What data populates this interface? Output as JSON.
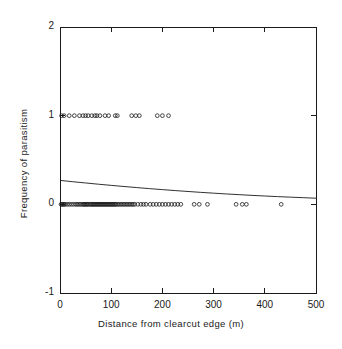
{
  "figure": {
    "background": "#ffffff",
    "ink_color": "#1a1a1a",
    "frame": {
      "left": 60,
      "right": 316,
      "top": 27,
      "bottom": 293
    }
  },
  "chart_data": {
    "type": "scatter",
    "title": "",
    "xlabel": "Distance from clearcut edge (m)",
    "ylabel": "Frequency of parasitism",
    "xlim": [
      0,
      500
    ],
    "ylim": [
      -1,
      2
    ],
    "xticks": [
      0,
      100,
      200,
      300,
      400,
      500
    ],
    "xtick_labels": [
      "0",
      "100",
      "200",
      "300",
      "400",
      "500"
    ],
    "yticks": [
      -1,
      0,
      1,
      2
    ],
    "ytick_labels": [
      "-1",
      "0",
      "1",
      "2"
    ],
    "grid": false,
    "legend": null,
    "marker": {
      "shape": "open-circle",
      "size": 3.0,
      "edge_color": "#1a1a1a",
      "fill": "none"
    },
    "series": [
      {
        "name": "Parasitized (y = 1)",
        "y_value": 1,
        "x": [
          3,
          8,
          18,
          28,
          38,
          45,
          50,
          55,
          62,
          68,
          72,
          78,
          88,
          95,
          108,
          112,
          140,
          148,
          155,
          190,
          200,
          212
        ]
      },
      {
        "name": "Not parasitized (y = 0)",
        "y_value": 0,
        "x": [
          2,
          4,
          6,
          8,
          10,
          14,
          18,
          22,
          26,
          30,
          33,
          36,
          39,
          42,
          45,
          47,
          49,
          51,
          53,
          55,
          58,
          60,
          62,
          64,
          66,
          68,
          70,
          72,
          74,
          76,
          78,
          80,
          82,
          84,
          86,
          88,
          90,
          92,
          94,
          96,
          98,
          100,
          102,
          104,
          106,
          108,
          110,
          113,
          116,
          119,
          122,
          125,
          128,
          131,
          134,
          137,
          140,
          143,
          146,
          152,
          158,
          163,
          168,
          176,
          182,
          188,
          194,
          200,
          206,
          212,
          218,
          224,
          230,
          236,
          262,
          272,
          288,
          344,
          356,
          364,
          432
        ]
      }
    ],
    "fit_curve": {
      "name": "Logistic regression fit",
      "model": "logistic",
      "line_color": "#1a1a1a",
      "line_width": 0.9,
      "x": [
        0,
        25,
        50,
        75,
        100,
        125,
        150,
        175,
        200,
        225,
        250,
        275,
        300,
        325,
        350,
        375,
        400,
        425,
        450,
        475,
        500
      ],
      "y": [
        0.27,
        0.255,
        0.241,
        0.227,
        0.214,
        0.201,
        0.189,
        0.177,
        0.166,
        0.155,
        0.145,
        0.135,
        0.126,
        0.117,
        0.109,
        0.101,
        0.094,
        0.087,
        0.081,
        0.075,
        0.069
      ]
    }
  }
}
